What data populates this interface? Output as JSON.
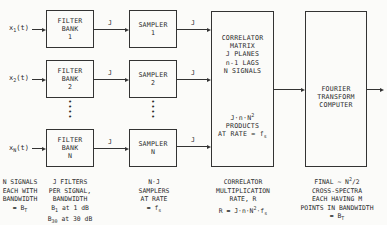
{
  "diagram": {
    "inputs": [
      {
        "label": "x",
        "sub": "1",
        "arg": "(t)"
      },
      {
        "label": "x",
        "sub": "2",
        "arg": "(t)"
      },
      {
        "label": "x",
        "sub": "N",
        "arg": "(t)"
      }
    ],
    "filter_banks": [
      {
        "line1": "FILTER",
        "line2": "BANK",
        "line3": "1"
      },
      {
        "line1": "FILTER",
        "line2": "BANK",
        "line3": "2"
      },
      {
        "line1": "FILTER",
        "line2": "BANK",
        "line3": "N"
      }
    ],
    "samplers": [
      {
        "line1": "SAMPLER",
        "line2": "1"
      },
      {
        "line1": "SAMPLER",
        "line2": "2"
      },
      {
        "line1": "SAMPLER",
        "line2": "N"
      }
    ],
    "edge_label": "J",
    "ellipsis": "•\n•\n•",
    "correlator": {
      "lines": [
        "CORRELATOR",
        "MATRIX",
        "J PLANES",
        "n-1 LAGS",
        "N SIGNALS"
      ],
      "products_line1": "J·n·N",
      "products_sup": "2",
      "products_line2": "PRODUCTS",
      "products_line3": "AT RATE = f",
      "products_sub": "s"
    },
    "fourier": {
      "lines": [
        "FOURIER",
        "TRANSFORM",
        "COMPUTER"
      ]
    },
    "captions": {
      "signals": [
        "N SIGNALS",
        "EACH WITH",
        "BANDWIDTH"
      ],
      "signals_bw": "= B",
      "signals_bw_sub": "T",
      "filters": [
        "J FILTERS",
        "PER SIGNAL,",
        "BANDWIDTH"
      ],
      "filters_b1": "B",
      "filters_b1_sub": "1",
      "filters_b1_rest": " at 1 dB",
      "filters_b30": "B",
      "filters_b30_sub": "30",
      "filters_b30_rest": " at 30 dB",
      "samplers": [
        "N·J",
        "SAMPLERS",
        "AT RATE"
      ],
      "samplers_rate": "= f",
      "samplers_rate_sub": "s",
      "correlator": [
        "CORRELATOR",
        "MULTIPLICATION",
        "RATE, R"
      ],
      "correlator_eq": "R = J·n·N",
      "correlator_eq_sup": "2",
      "correlator_eq_rest": "·f",
      "correlator_eq_sub": "s",
      "final_line1": "FINAL ~ N",
      "final_sup": "2",
      "final_line1_rest": "/2",
      "final": [
        "CROSS-SPECTRA",
        "EACH HAVING M",
        "POINTS IN BANDWIDTH"
      ],
      "final_bw": "= B",
      "final_bw_sub": "T"
    }
  }
}
